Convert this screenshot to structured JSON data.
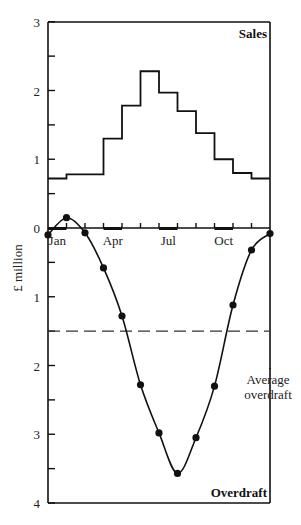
{
  "chart_data": [
    {
      "type": "bar",
      "style": "step",
      "title": "Sales",
      "categories": [
        "Jan",
        "Feb",
        "Mar",
        "Apr",
        "May",
        "Jun",
        "Jul",
        "Aug",
        "Sep",
        "Oct",
        "Nov",
        "Dec"
      ],
      "values": [
        0.72,
        0.78,
        0.78,
        1.3,
        1.78,
        2.28,
        1.97,
        1.7,
        1.38,
        1.0,
        0.8,
        0.72
      ],
      "ylabel": "£ million",
      "ylim": [
        0,
        3
      ],
      "yticks": [
        0,
        1,
        2,
        3
      ],
      "grid": false
    },
    {
      "type": "line",
      "title": "Overdraft",
      "x": [
        0,
        1,
        2,
        3,
        4,
        5,
        6,
        7,
        8,
        9,
        10,
        11,
        12
      ],
      "values": [
        0.1,
        -0.15,
        0.07,
        0.58,
        1.28,
        2.28,
        2.98,
        3.57,
        3.05,
        2.3,
        1.12,
        0.32,
        0.08
      ],
      "note": "positive = overdraft depth below zero line; month boundaries Jan..Dec",
      "ylabel": "£ million",
      "ylim": [
        0,
        4
      ],
      "yticks": [
        0,
        1,
        2,
        3,
        4
      ],
      "inverted_y": true,
      "reference_line": {
        "label": "Average overdraft",
        "value": 1.5,
        "style": "dashed"
      },
      "grid": false
    }
  ],
  "axes": {
    "ylabel": "£ million",
    "upper_ticks": [
      "3",
      "2",
      "1",
      "0"
    ],
    "lower_ticks": [
      "1",
      "2",
      "3",
      "4"
    ],
    "month_labels": [
      "Jan",
      "Apr",
      "Jul",
      "Oct"
    ]
  },
  "labels": {
    "sales": "Sales",
    "overdraft": "Overdraft",
    "average_line_1": "Average",
    "average_line_2": "overdraft"
  }
}
